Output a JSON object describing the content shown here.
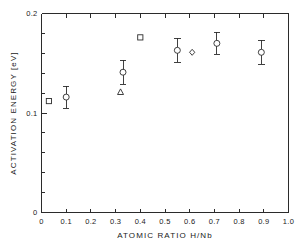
{
  "chart_data": {
    "type": "scatter",
    "title": "",
    "xlabel": "ATOMIC RATIO  H/Nb",
    "ylabel": "ACTIVATION  ENERGY  [eV]",
    "xlim": [
      0,
      1.0
    ],
    "ylim": [
      0,
      0.2
    ],
    "grid": false,
    "legend": "none",
    "x_ticks": [
      0,
      0.1,
      0.2,
      0.3,
      0.4,
      0.5,
      0.6,
      0.7,
      0.8,
      0.9,
      1.0
    ],
    "x_tick_labels": [
      "0",
      "0.1",
      "0.2",
      "0.3",
      "0.4",
      "0.5",
      "0.6",
      "0.7",
      "0.8",
      "0.9",
      "1.0"
    ],
    "y_ticks": [
      0,
      0.1,
      0.2
    ],
    "y_tick_labels": [
      "0",
      "0.1",
      "0.2"
    ],
    "y_minor_ticks": [
      0.02,
      0.04,
      0.06,
      0.08,
      0.12,
      0.14,
      0.16,
      0.18
    ],
    "series": [
      {
        "name": "circles-with-error-bars",
        "marker": "circle",
        "points": [
          {
            "x": 0.1,
            "y": 0.116,
            "yerr": 0.011
          },
          {
            "x": 0.33,
            "y": 0.141,
            "yerr": 0.012
          },
          {
            "x": 0.55,
            "y": 0.163,
            "yerr": 0.012
          },
          {
            "x": 0.71,
            "y": 0.17,
            "yerr": 0.011
          },
          {
            "x": 0.89,
            "y": 0.161,
            "yerr": 0.012
          }
        ]
      },
      {
        "name": "squares",
        "marker": "square",
        "points": [
          {
            "x": 0.03,
            "y": 0.112,
            "yerr": 0
          },
          {
            "x": 0.4,
            "y": 0.176,
            "yerr": 0
          }
        ]
      },
      {
        "name": "triangle",
        "marker": "triangle",
        "points": [
          {
            "x": 0.32,
            "y": 0.121,
            "yerr": 0
          }
        ]
      },
      {
        "name": "diamond",
        "marker": "diamond",
        "points": [
          {
            "x": 0.61,
            "y": 0.161,
            "yerr": 0
          }
        ]
      }
    ]
  },
  "colors": {
    "axis": "#2b2b2b",
    "text": "#1a1a1a",
    "background": "#ffffff",
    "marker_fill": "#ffffff"
  }
}
